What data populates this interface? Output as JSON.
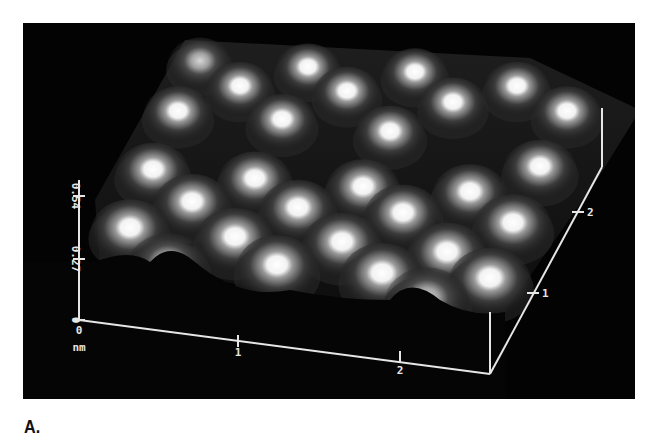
{
  "figure": {
    "label": "A.",
    "background_color": "#030303",
    "axis_color": "#e6e6e6"
  },
  "chart_data": {
    "type": "surface3d",
    "title": "",
    "z_axis": {
      "label": "",
      "ticks": [
        "0",
        "0.27",
        "0.54"
      ],
      "range": [
        0,
        0.54
      ]
    },
    "x_axis": {
      "label": "nm",
      "ticks": [
        "0",
        "1",
        "2"
      ],
      "range": [
        0,
        2.6
      ]
    },
    "y_axis": {
      "label": "",
      "ticks": [
        "1",
        "2"
      ],
      "range": [
        0,
        2.6
      ]
    },
    "units": "nm",
    "grid": false,
    "legend": null,
    "peaks_screen_px": [
      [
        200,
        57,
        0.7
      ],
      [
        308,
        63,
        0.95
      ],
      [
        415,
        68,
        1.0
      ],
      [
        240,
        82,
        0.95
      ],
      [
        347,
        87,
        1.0
      ],
      [
        453,
        98,
        0.85
      ],
      [
        517,
        82,
        0.8
      ],
      [
        178,
        107,
        0.9
      ],
      [
        282,
        115,
        0.95
      ],
      [
        390,
        127,
        0.75
      ],
      [
        567,
        107,
        0.9
      ],
      [
        153,
        165,
        0.85
      ],
      [
        255,
        174,
        0.8
      ],
      [
        363,
        182,
        0.85
      ],
      [
        470,
        187,
        0.85
      ],
      [
        540,
        162,
        0.95
      ],
      [
        192,
        197,
        1.0
      ],
      [
        298,
        203,
        0.95
      ],
      [
        403,
        208,
        0.95
      ],
      [
        513,
        218,
        0.9
      ],
      [
        130,
        223,
        0.85
      ],
      [
        235,
        232,
        0.9
      ],
      [
        342,
        237,
        0.85
      ],
      [
        447,
        247,
        0.85
      ],
      [
        168,
        258,
        0.55
      ],
      [
        277,
        260,
        0.9
      ],
      [
        382,
        268,
        0.8
      ],
      [
        490,
        273,
        0.95
      ],
      [
        427,
        293,
        0.5
      ]
    ]
  },
  "axes": {
    "z_ticks": [
      {
        "label": "0.54",
        "y": 196
      },
      {
        "label": "0.27",
        "y": 259
      },
      {
        "label": "0",
        "y": 320
      }
    ],
    "x_ticks": [
      {
        "label": "0",
        "x": 79,
        "y": 320
      },
      {
        "label": "1",
        "x": 238,
        "y": 341
      },
      {
        "label": "2",
        "x": 400,
        "y": 357
      }
    ],
    "y_ticks": [
      {
        "label": "1",
        "x": 533,
        "y": 293
      },
      {
        "label": "2",
        "x": 578,
        "y": 212
      }
    ],
    "unit_label": "nm",
    "zero_label": "0",
    "x_zero_label": "0",
    "x_one_label": "1",
    "x_two_label": "2",
    "y_one_label": "1",
    "y_two_label": "2",
    "z_top_label": "0.54",
    "z_mid_label": "0.27",
    "z_zero_label": "0"
  }
}
